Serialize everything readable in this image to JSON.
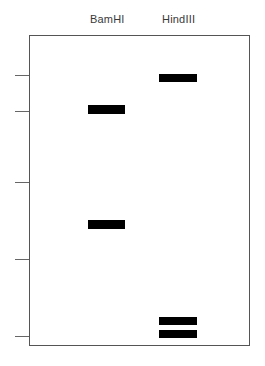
{
  "diagram": {
    "type": "gel-electrophoresis",
    "lanes": [
      {
        "label": "BamHI",
        "label_x": 90,
        "bands": [
          {
            "x": 88,
            "y": 105,
            "width": 37,
            "height": 9
          },
          {
            "x": 88,
            "y": 220,
            "width": 37,
            "height": 9
          }
        ]
      },
      {
        "label": "HindIII",
        "label_x": 162,
        "bands": [
          {
            "x": 159,
            "y": 74,
            "width": 38,
            "height": 8
          },
          {
            "x": 159,
            "y": 317,
            "width": 38,
            "height": 8
          },
          {
            "x": 159,
            "y": 330,
            "width": 38,
            "height": 8
          }
        ]
      }
    ],
    "marker_ticks_y": [
      75,
      111,
      182,
      259,
      336
    ],
    "colors": {
      "band": "#000000",
      "frame": "#555555",
      "tick": "#666666",
      "label": "#3a3a3a",
      "background": "#ffffff"
    }
  }
}
